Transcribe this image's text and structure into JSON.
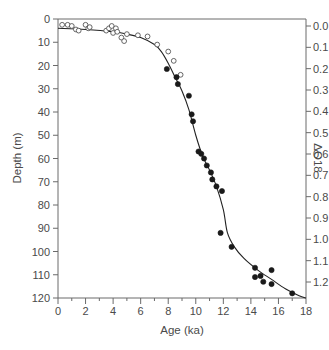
{
  "chart_data": {
    "type": "scatter",
    "title": "",
    "xlabel": "Age (ka)",
    "ylabel": "Depth (m)",
    "y2label": "ΔO18",
    "xlim": [
      0,
      18
    ],
    "ylim": [
      120,
      0
    ],
    "y2lim": [
      0.0,
      1.2
    ],
    "x_ticks": [
      0,
      2,
      4,
      6,
      8,
      10,
      12,
      14,
      16,
      18
    ],
    "y_ticks": [
      0,
      10,
      20,
      30,
      40,
      50,
      60,
      70,
      80,
      90,
      100,
      110,
      120
    ],
    "y2_ticks": [
      "0.0",
      "0.1",
      "0.2",
      "0.3",
      "0.4",
      "0.5",
      "0.6",
      "0.7",
      "0.8",
      "0.9",
      "1.0",
      "1.1",
      "1.2"
    ],
    "grid": false,
    "legend": null,
    "series": [
      {
        "name": "open circles",
        "marker": "open-circle",
        "points": [
          [
            0.3,
            2.5
          ],
          [
            0.7,
            2.5
          ],
          [
            1.0,
            3.0
          ],
          [
            1.3,
            4.5
          ],
          [
            1.5,
            5.0
          ],
          [
            2.0,
            2.5
          ],
          [
            2.2,
            4.0
          ],
          [
            2.3,
            3.5
          ],
          [
            3.5,
            5.0
          ],
          [
            3.7,
            4.0
          ],
          [
            3.9,
            3.0
          ],
          [
            4.0,
            6.0
          ],
          [
            4.2,
            4.0
          ],
          [
            4.3,
            5.5
          ],
          [
            4.6,
            8.0
          ],
          [
            4.8,
            9.5
          ],
          [
            5.0,
            6.5
          ],
          [
            5.8,
            7.0
          ],
          [
            6.5,
            7.5
          ],
          [
            7.2,
            11.0
          ],
          [
            8.0,
            14.0
          ],
          [
            8.4,
            18.0
          ],
          [
            8.9,
            24.0
          ]
        ]
      },
      {
        "name": "filled circles",
        "marker": "filled-circle",
        "points": [
          [
            7.9,
            21.5
          ],
          [
            8.6,
            25.0
          ],
          [
            8.7,
            28.0
          ],
          [
            9.5,
            33.0
          ],
          [
            9.7,
            41.0
          ],
          [
            9.8,
            44.0
          ],
          [
            10.2,
            57.0
          ],
          [
            10.4,
            58.0
          ],
          [
            10.6,
            60.0
          ],
          [
            10.8,
            63.0
          ],
          [
            11.1,
            66.0
          ],
          [
            11.2,
            69.0
          ],
          [
            11.5,
            72.0
          ],
          [
            11.9,
            74.0
          ],
          [
            11.8,
            92.0
          ],
          [
            12.6,
            98.0
          ],
          [
            14.3,
            107.0
          ],
          [
            14.3,
            111.0
          ],
          [
            14.7,
            110.5
          ],
          [
            14.9,
            113.0
          ],
          [
            15.5,
            108.0
          ],
          [
            15.5,
            114.0
          ],
          [
            17.0,
            118.0
          ]
        ]
      },
      {
        "name": "fitted curve",
        "marker": "line",
        "points": [
          [
            0,
            4
          ],
          [
            2,
            4.5
          ],
          [
            4,
            5.5
          ],
          [
            5,
            6.5
          ],
          [
            6,
            8
          ],
          [
            7,
            11
          ],
          [
            7.5,
            14
          ],
          [
            8,
            19
          ],
          [
            8.5,
            25
          ],
          [
            9,
            31
          ],
          [
            9.5,
            39
          ],
          [
            10,
            50
          ],
          [
            10.5,
            59
          ],
          [
            11,
            65
          ],
          [
            11.5,
            72
          ],
          [
            12,
            82
          ],
          [
            12.3,
            92
          ],
          [
            12.8,
            98
          ],
          [
            13.5,
            103
          ],
          [
            14.5,
            108
          ],
          [
            15.5,
            112
          ],
          [
            16.5,
            116
          ],
          [
            17.5,
            119
          ],
          [
            18,
            120
          ]
        ]
      }
    ]
  },
  "axes": {
    "x_title": "Age (ka)",
    "y_title": "Depth (m)",
    "y2_title": "ΔO18"
  }
}
